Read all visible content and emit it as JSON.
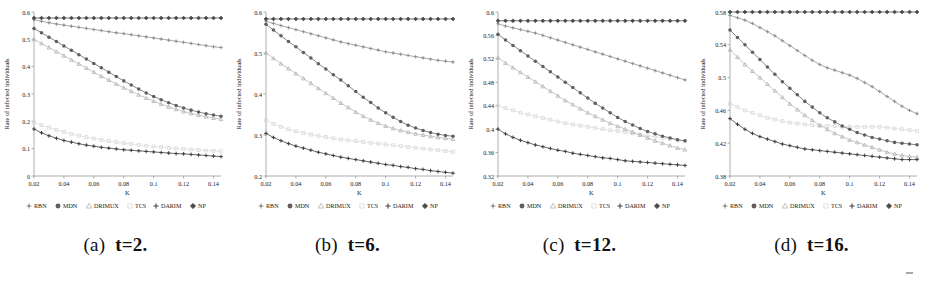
{
  "figure": {
    "panel_count": 4,
    "xlabel": "K",
    "ylabel": "Rate of infected individuals",
    "x_ticks": [
      "0.02",
      "0.04",
      "0.06",
      "0.08",
      "0.1",
      "0.12",
      "0.14"
    ],
    "legend_labels": [
      "RBN",
      "MDN",
      "DRIMUX",
      "TCS",
      "DARIM",
      "NP"
    ]
  },
  "captions": [
    {
      "label": "(a)",
      "value": "t=2."
    },
    {
      "label": "(b)",
      "value": "t=6."
    },
    {
      "label": "(c)",
      "value": "t=12."
    },
    {
      "label": "(d)",
      "value": "t=16."
    }
  ],
  "colors": {
    "RBN": "#8e8e8e",
    "MDN": "#5f5f5f",
    "DRIMUX": "#b5b5b5",
    "TCS": "#dcdcdc",
    "DARIM": "#3a3a3a",
    "NP": "#4a4a4a",
    "axis": "#9a9a9a",
    "text": "#1a1a1a",
    "background": "#ffffff"
  },
  "chart_data": [
    {
      "type": "line",
      "title": "(a) t=2.",
      "xlabel": "K",
      "ylabel": "Rate of infected individuals",
      "xlim": [
        0.02,
        0.145
      ],
      "ylim": [
        0,
        0.6
      ],
      "x_ticks": [
        0.02,
        0.04,
        0.06,
        0.08,
        0.1,
        0.12,
        0.14
      ],
      "y_ticks": [
        0,
        0.1,
        0.2,
        0.3,
        0.4,
        0.5,
        0.6
      ],
      "grid": false,
      "legend_position": "below-axis",
      "x": [
        0.02,
        0.025,
        0.03,
        0.035,
        0.04,
        0.045,
        0.05,
        0.055,
        0.06,
        0.065,
        0.07,
        0.075,
        0.08,
        0.085,
        0.09,
        0.095,
        0.1,
        0.105,
        0.11,
        0.115,
        0.12,
        0.125,
        0.13,
        0.135,
        0.14,
        0.145
      ],
      "series": [
        {
          "name": "NP",
          "marker": "diamond",
          "values": [
            0.578,
            0.578,
            0.578,
            0.578,
            0.578,
            0.578,
            0.578,
            0.578,
            0.578,
            0.578,
            0.578,
            0.578,
            0.578,
            0.578,
            0.578,
            0.578,
            0.578,
            0.578,
            0.578,
            0.578,
            0.578,
            0.578,
            0.578,
            0.578,
            0.578,
            0.578
          ]
        },
        {
          "name": "RBN",
          "marker": "plus",
          "values": [
            0.572,
            0.566,
            0.561,
            0.556,
            0.552,
            0.548,
            0.544,
            0.54,
            0.536,
            0.532,
            0.528,
            0.524,
            0.521,
            0.517,
            0.513,
            0.509,
            0.505,
            0.501,
            0.497,
            0.493,
            0.489,
            0.485,
            0.481,
            0.477,
            0.473,
            0.47
          ]
        },
        {
          "name": "MDN",
          "marker": "asterisk",
          "values": [
            0.54,
            0.524,
            0.508,
            0.492,
            0.476,
            0.46,
            0.444,
            0.428,
            0.412,
            0.396,
            0.38,
            0.364,
            0.348,
            0.333,
            0.318,
            0.304,
            0.291,
            0.279,
            0.268,
            0.258,
            0.249,
            0.241,
            0.234,
            0.228,
            0.223,
            0.219
          ]
        },
        {
          "name": "DRIMUX",
          "marker": "triangle",
          "values": [
            0.5,
            0.485,
            0.47,
            0.455,
            0.44,
            0.425,
            0.41,
            0.395,
            0.38,
            0.365,
            0.351,
            0.337,
            0.323,
            0.31,
            0.297,
            0.285,
            0.274,
            0.263,
            0.253,
            0.244,
            0.236,
            0.229,
            0.223,
            0.217,
            0.212,
            0.208
          ]
        },
        {
          "name": "TCS",
          "marker": "square",
          "values": [
            0.196,
            0.186,
            0.177,
            0.169,
            0.161,
            0.154,
            0.148,
            0.142,
            0.137,
            0.132,
            0.128,
            0.124,
            0.12,
            0.117,
            0.114,
            0.111,
            0.108,
            0.106,
            0.103,
            0.101,
            0.099,
            0.097,
            0.095,
            0.093,
            0.092,
            0.09
          ]
        },
        {
          "name": "DARIM",
          "marker": "cross",
          "values": [
            0.172,
            0.158,
            0.147,
            0.138,
            0.13,
            0.124,
            0.118,
            0.113,
            0.109,
            0.105,
            0.102,
            0.099,
            0.096,
            0.094,
            0.092,
            0.09,
            0.088,
            0.086,
            0.084,
            0.082,
            0.081,
            0.079,
            0.077,
            0.075,
            0.073,
            0.071
          ]
        }
      ]
    },
    {
      "type": "line",
      "title": "(b) t=6.",
      "xlabel": "K",
      "ylabel": "Rate of infected individuals",
      "xlim": [
        0.02,
        0.145
      ],
      "ylim": [
        0.2,
        0.6
      ],
      "x_ticks": [
        0.02,
        0.04,
        0.06,
        0.08,
        0.1,
        0.12,
        0.14
      ],
      "y_ticks": [
        0.2,
        0.3,
        0.4,
        0.5,
        0.6
      ],
      "grid": false,
      "legend_position": "below-axis",
      "x": [
        0.02,
        0.025,
        0.03,
        0.035,
        0.04,
        0.045,
        0.05,
        0.055,
        0.06,
        0.065,
        0.07,
        0.075,
        0.08,
        0.085,
        0.09,
        0.095,
        0.1,
        0.105,
        0.11,
        0.115,
        0.12,
        0.125,
        0.13,
        0.135,
        0.14,
        0.145
      ],
      "series": [
        {
          "name": "NP",
          "marker": "diamond",
          "values": [
            0.583,
            0.583,
            0.583,
            0.583,
            0.583,
            0.583,
            0.583,
            0.583,
            0.583,
            0.583,
            0.583,
            0.583,
            0.583,
            0.583,
            0.583,
            0.583,
            0.583,
            0.583,
            0.583,
            0.583,
            0.583,
            0.583,
            0.583,
            0.583,
            0.583,
            0.583
          ]
        },
        {
          "name": "RBN",
          "marker": "plus",
          "values": [
            0.578,
            0.572,
            0.567,
            0.562,
            0.557,
            0.552,
            0.547,
            0.542,
            0.537,
            0.532,
            0.527,
            0.523,
            0.519,
            0.515,
            0.511,
            0.507,
            0.503,
            0.5,
            0.497,
            0.494,
            0.491,
            0.488,
            0.485,
            0.482,
            0.48,
            0.478
          ]
        },
        {
          "name": "MDN",
          "marker": "asterisk",
          "values": [
            0.57,
            0.556,
            0.542,
            0.528,
            0.515,
            0.501,
            0.488,
            0.474,
            0.461,
            0.447,
            0.434,
            0.42,
            0.406,
            0.392,
            0.379,
            0.366,
            0.354,
            0.343,
            0.333,
            0.324,
            0.317,
            0.311,
            0.306,
            0.302,
            0.299,
            0.297
          ]
        },
        {
          "name": "DRIMUX",
          "marker": "triangle",
          "values": [
            0.5,
            0.487,
            0.474,
            0.462,
            0.45,
            0.438,
            0.426,
            0.414,
            0.402,
            0.39,
            0.378,
            0.367,
            0.356,
            0.346,
            0.337,
            0.329,
            0.322,
            0.316,
            0.311,
            0.307,
            0.303,
            0.3,
            0.297,
            0.294,
            0.292,
            0.29
          ]
        },
        {
          "name": "TCS",
          "marker": "square",
          "values": [
            0.336,
            0.327,
            0.32,
            0.314,
            0.309,
            0.305,
            0.301,
            0.298,
            0.295,
            0.292,
            0.289,
            0.287,
            0.285,
            0.283,
            0.281,
            0.279,
            0.277,
            0.275,
            0.273,
            0.271,
            0.269,
            0.267,
            0.265,
            0.263,
            0.261,
            0.259
          ]
        },
        {
          "name": "DARIM",
          "marker": "cross",
          "values": [
            0.304,
            0.294,
            0.286,
            0.279,
            0.273,
            0.268,
            0.263,
            0.258,
            0.254,
            0.25,
            0.246,
            0.243,
            0.24,
            0.237,
            0.234,
            0.231,
            0.228,
            0.226,
            0.223,
            0.221,
            0.218,
            0.216,
            0.213,
            0.211,
            0.209,
            0.207
          ]
        }
      ]
    },
    {
      "type": "line",
      "title": "(c) t=12.",
      "xlabel": "K",
      "ylabel": "Rate of infected individuals",
      "xlim": [
        0.02,
        0.145
      ],
      "ylim": [
        0.32,
        0.6
      ],
      "x_ticks": [
        0.02,
        0.04,
        0.06,
        0.08,
        0.1,
        0.12,
        0.14
      ],
      "y_ticks": [
        0.32,
        0.36,
        0.4,
        0.44,
        0.48,
        0.52,
        0.56,
        0.6
      ],
      "grid": false,
      "legend_position": "below-axis",
      "x": [
        0.02,
        0.025,
        0.03,
        0.035,
        0.04,
        0.045,
        0.05,
        0.055,
        0.06,
        0.065,
        0.07,
        0.075,
        0.08,
        0.085,
        0.09,
        0.095,
        0.1,
        0.105,
        0.11,
        0.115,
        0.12,
        0.125,
        0.13,
        0.135,
        0.14,
        0.145
      ],
      "series": [
        {
          "name": "NP",
          "marker": "diamond",
          "values": [
            0.585,
            0.585,
            0.585,
            0.585,
            0.585,
            0.585,
            0.585,
            0.585,
            0.585,
            0.585,
            0.585,
            0.585,
            0.585,
            0.585,
            0.585,
            0.585,
            0.585,
            0.585,
            0.585,
            0.585,
            0.585,
            0.585,
            0.585,
            0.585,
            0.585,
            0.585
          ]
        },
        {
          "name": "RBN",
          "marker": "plus",
          "values": [
            0.58,
            0.576,
            0.573,
            0.57,
            0.567,
            0.564,
            0.56,
            0.556,
            0.552,
            0.548,
            0.544,
            0.54,
            0.536,
            0.532,
            0.528,
            0.524,
            0.52,
            0.516,
            0.512,
            0.508,
            0.504,
            0.5,
            0.496,
            0.492,
            0.488,
            0.484
          ]
        },
        {
          "name": "MDN",
          "marker": "asterisk",
          "values": [
            0.562,
            0.552,
            0.543,
            0.534,
            0.525,
            0.516,
            0.507,
            0.498,
            0.489,
            0.48,
            0.471,
            0.462,
            0.453,
            0.444,
            0.436,
            0.428,
            0.42,
            0.413,
            0.407,
            0.401,
            0.396,
            0.392,
            0.388,
            0.385,
            0.382,
            0.38
          ]
        },
        {
          "name": "DRIMUX",
          "marker": "triangle",
          "values": [
            0.522,
            0.513,
            0.505,
            0.497,
            0.489,
            0.481,
            0.473,
            0.465,
            0.457,
            0.449,
            0.442,
            0.435,
            0.428,
            0.422,
            0.416,
            0.41,
            0.405,
            0.4,
            0.395,
            0.39,
            0.385,
            0.38,
            0.376,
            0.372,
            0.368,
            0.365
          ]
        },
        {
          "name": "TCS",
          "marker": "square",
          "values": [
            0.44,
            0.436,
            0.432,
            0.428,
            0.425,
            0.422,
            0.419,
            0.416,
            0.413,
            0.41,
            0.408,
            0.406,
            0.404,
            0.402,
            0.4,
            0.398,
            0.397,
            0.395,
            0.393,
            0.391,
            0.389,
            0.387,
            0.385,
            0.383,
            0.381,
            0.379
          ]
        },
        {
          "name": "DARIM",
          "marker": "cross",
          "values": [
            0.4,
            0.392,
            0.386,
            0.381,
            0.377,
            0.373,
            0.37,
            0.367,
            0.364,
            0.362,
            0.359,
            0.357,
            0.355,
            0.353,
            0.351,
            0.35,
            0.348,
            0.346,
            0.345,
            0.344,
            0.343,
            0.342,
            0.341,
            0.34,
            0.339,
            0.338
          ]
        }
      ]
    },
    {
      "type": "line",
      "title": "(d) t=16.",
      "xlabel": "K",
      "ylabel": "Rate of infected individuals",
      "xlim": [
        0.02,
        0.145
      ],
      "ylim": [
        0.38,
        0.58
      ],
      "x_ticks": [
        0.02,
        0.04,
        0.06,
        0.08,
        0.1,
        0.12,
        0.14
      ],
      "y_ticks": [
        0.38,
        0.42,
        0.46,
        0.5,
        0.54,
        0.58
      ],
      "grid": false,
      "legend_position": "below-axis",
      "x": [
        0.02,
        0.025,
        0.03,
        0.035,
        0.04,
        0.045,
        0.05,
        0.055,
        0.06,
        0.065,
        0.07,
        0.075,
        0.08,
        0.085,
        0.09,
        0.095,
        0.1,
        0.105,
        0.11,
        0.115,
        0.12,
        0.125,
        0.13,
        0.135,
        0.14,
        0.145
      ],
      "series": [
        {
          "name": "NP",
          "marker": "diamond",
          "values": [
            0.58,
            0.58,
            0.58,
            0.58,
            0.58,
            0.58,
            0.58,
            0.58,
            0.58,
            0.58,
            0.58,
            0.58,
            0.58,
            0.58,
            0.58,
            0.58,
            0.58,
            0.58,
            0.58,
            0.58,
            0.58,
            0.58,
            0.58,
            0.58,
            0.58,
            0.58
          ]
        },
        {
          "name": "RBN",
          "marker": "plus",
          "values": [
            0.576,
            0.573,
            0.57,
            0.566,
            0.561,
            0.556,
            0.551,
            0.545,
            0.539,
            0.533,
            0.527,
            0.521,
            0.516,
            0.512,
            0.509,
            0.506,
            0.503,
            0.499,
            0.494,
            0.489,
            0.483,
            0.477,
            0.471,
            0.465,
            0.46,
            0.456
          ]
        },
        {
          "name": "MDN",
          "marker": "asterisk",
          "values": [
            0.558,
            0.549,
            0.54,
            0.531,
            0.522,
            0.513,
            0.504,
            0.495,
            0.487,
            0.479,
            0.471,
            0.464,
            0.457,
            0.451,
            0.446,
            0.441,
            0.437,
            0.433,
            0.43,
            0.427,
            0.425,
            0.423,
            0.421,
            0.42,
            0.419,
            0.418
          ]
        },
        {
          "name": "DRIMUX",
          "marker": "triangle",
          "values": [
            0.534,
            0.525,
            0.516,
            0.508,
            0.5,
            0.492,
            0.484,
            0.476,
            0.468,
            0.461,
            0.454,
            0.448,
            0.442,
            0.437,
            0.432,
            0.428,
            0.424,
            0.421,
            0.418,
            0.415,
            0.412,
            0.409,
            0.407,
            0.405,
            0.404,
            0.403
          ]
        },
        {
          "name": "TCS",
          "marker": "square",
          "values": [
            0.468,
            0.464,
            0.46,
            0.457,
            0.454,
            0.451,
            0.449,
            0.447,
            0.445,
            0.444,
            0.443,
            0.442,
            0.441,
            0.441,
            0.441,
            0.44,
            0.44,
            0.44,
            0.44,
            0.44,
            0.44,
            0.439,
            0.438,
            0.437,
            0.436,
            0.435
          ]
        },
        {
          "name": "DARIM",
          "marker": "cross",
          "values": [
            0.45,
            0.443,
            0.437,
            0.432,
            0.428,
            0.425,
            0.422,
            0.419,
            0.417,
            0.415,
            0.413,
            0.412,
            0.411,
            0.41,
            0.409,
            0.408,
            0.407,
            0.406,
            0.405,
            0.404,
            0.403,
            0.402,
            0.401,
            0.4,
            0.4,
            0.4
          ]
        }
      ]
    }
  ]
}
